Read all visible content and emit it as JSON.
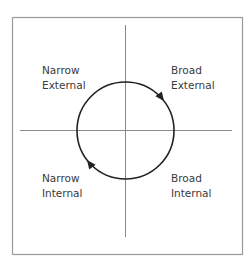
{
  "diagram": {
    "quadrants": {
      "top_left": {
        "line1": "Narrow",
        "line2": "External"
      },
      "top_right": {
        "line1": "Broad",
        "line2": "External"
      },
      "bottom_left": {
        "line1": "Narrow",
        "line2": "Internal"
      },
      "bottom_right": {
        "line1": "Broad",
        "line2": "Internal"
      }
    },
    "cycle_direction": "clockwise",
    "colors": {
      "frame": "#9a9a9a",
      "axes": "#8a8a8a",
      "circle": "#222222",
      "text": "#3a3a3a"
    }
  }
}
